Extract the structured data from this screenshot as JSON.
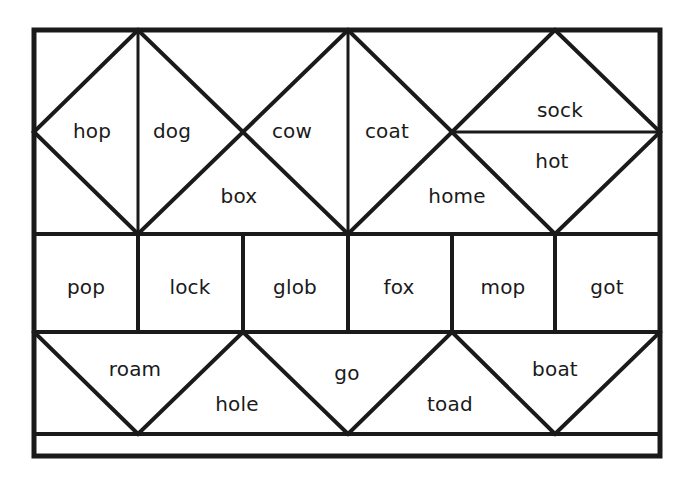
{
  "worksheet": {
    "title": "Word sort grid worksheet",
    "background_color": "#ffffff",
    "line_color": "#1a1a1a",
    "text_color": "#1a1a1a",
    "frame": {
      "x": 34,
      "y": 30,
      "width": 626,
      "height": 426
    },
    "rows": [
      {
        "name": "top-row-diamonds",
        "y_top": 30,
        "y_bottom": 234,
        "cells": [
          {
            "id": "hop",
            "label": "hop",
            "x": 92,
            "y": 132
          },
          {
            "id": "dog",
            "label": "dog",
            "x": 172,
            "y": 132
          },
          {
            "id": "box",
            "label": "box",
            "x": 239,
            "y": 197
          },
          {
            "id": "cow",
            "label": "cow",
            "x": 292,
            "y": 132
          },
          {
            "id": "coat",
            "label": "coat",
            "x": 387,
            "y": 132
          },
          {
            "id": "home",
            "label": "home",
            "x": 457,
            "y": 197
          },
          {
            "id": "sock",
            "label": "sock",
            "x": 560,
            "y": 111
          },
          {
            "id": "hot",
            "label": "hot",
            "x": 552,
            "y": 162
          }
        ]
      },
      {
        "name": "middle-row-rectangles",
        "y_top": 234,
        "y_bottom": 332,
        "cells": [
          {
            "id": "pop",
            "label": "pop",
            "x": 86,
            "y": 288
          },
          {
            "id": "lock",
            "label": "lock",
            "x": 190,
            "y": 288
          },
          {
            "id": "glob",
            "label": "glob",
            "x": 295,
            "y": 288
          },
          {
            "id": "fox",
            "label": "fox",
            "x": 399,
            "y": 288
          },
          {
            "id": "mop",
            "label": "mop",
            "x": 503,
            "y": 288
          },
          {
            "id": "got",
            "label": "got",
            "x": 607,
            "y": 288
          }
        ]
      },
      {
        "name": "bottom-row-triangles",
        "y_top": 332,
        "y_bottom": 434,
        "cells": [
          {
            "id": "roam",
            "label": "roam",
            "x": 135,
            "y": 370
          },
          {
            "id": "hole",
            "label": "hole",
            "x": 237,
            "y": 405
          },
          {
            "id": "go",
            "label": "go",
            "x": 347,
            "y": 374
          },
          {
            "id": "toad",
            "label": "toad",
            "x": 450,
            "y": 405
          },
          {
            "id": "boat",
            "label": "boat",
            "x": 555,
            "y": 370
          }
        ]
      },
      {
        "name": "bottom-blank-strip",
        "y_top": 434,
        "y_bottom": 456,
        "cells": []
      }
    ],
    "all_words": [
      "hop",
      "dog",
      "box",
      "cow",
      "coat",
      "home",
      "sock",
      "hot",
      "pop",
      "lock",
      "glob",
      "fox",
      "mop",
      "got",
      "roam",
      "hole",
      "go",
      "toad",
      "boat"
    ]
  }
}
